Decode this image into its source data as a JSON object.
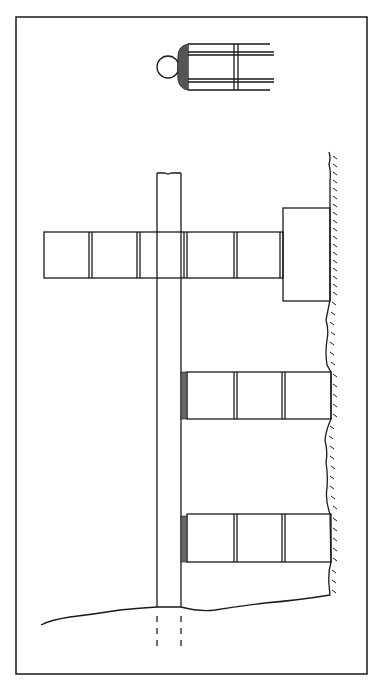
{
  "figure": {
    "type": "technical line drawing",
    "colors": {
      "line": "#1a1a1a",
      "background": "#ffffff",
      "frame": "#222222"
    }
  },
  "elements": {
    "frame": {
      "x": 16,
      "y": 17,
      "w": 351,
      "h": 168
    },
    "inset_detail": {
      "circle_cx": 168,
      "circle_cy": 67,
      "circle_r": 11
    },
    "post": {
      "x": 157,
      "y": 173,
      "w": 24,
      "bottom_y": 607
    },
    "upper_arm": {
      "x": 44,
      "y": 232,
      "w": 239,
      "h": 46,
      "segments": 5
    },
    "footing_block": {
      "x": 283,
      "y": 208,
      "w": 47,
      "h": 93
    },
    "middle_arm": {
      "x": 187,
      "y": 372,
      "w": 144,
      "h": 47,
      "segments": 3
    },
    "lower_arm": {
      "x": 187,
      "y": 514,
      "w": 144,
      "h": 48,
      "segments": 3
    },
    "wall_x": 330,
    "ground_line_y": 607
  }
}
